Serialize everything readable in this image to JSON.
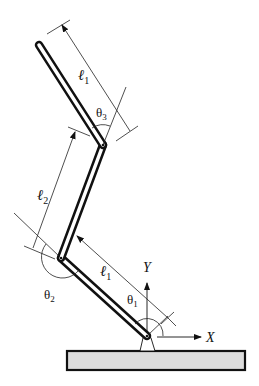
{
  "diagram": {
    "title": "",
    "type": "planar three-link robotic arm",
    "colors": {
      "link_outline": "#111111",
      "link_fill": "#ffffff",
      "base_fill": "#dcdcdc",
      "base_outline": "#111111",
      "dimension_lines": "#222222"
    },
    "labels": {
      "link_top_length": "ℓ",
      "link_top_sub": "1",
      "link_mid_length": "ℓ",
      "link_mid_sub": "2",
      "link_bottom_length": "ℓ",
      "link_bottom_sub": "1",
      "theta1": "θ",
      "theta1_sub": "1",
      "theta2": "θ",
      "theta2_sub": "2",
      "theta3": "θ",
      "theta3_sub": "3",
      "axis_x": "X",
      "axis_y": "Y"
    },
    "components": [
      {
        "name": "base-plate"
      },
      {
        "name": "base-pivot"
      },
      {
        "name": "link-1-lower",
        "length_label": "ℓ1",
        "joint_angle": "θ1"
      },
      {
        "name": "link-2-middle",
        "length_label": "ℓ2",
        "joint_angle": "θ2"
      },
      {
        "name": "link-3-upper",
        "length_label": "ℓ1",
        "joint_angle": "θ3"
      }
    ]
  }
}
